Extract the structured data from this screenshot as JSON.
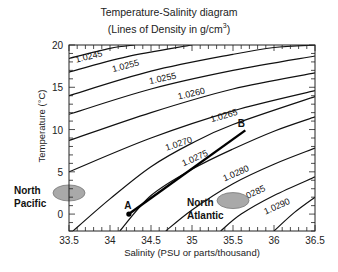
{
  "chart_data": {
    "type": "line",
    "title": "Temperature-Salinity diagram",
    "subtitle_prefix": "(Lines of Density in g/cm",
    "subtitle_sup": "3",
    "subtitle_suffix": ")",
    "xlabel": "Salinity (PSU or parts/thousand)",
    "ylabel": "Temperature (°C)",
    "xlim": [
      33.5,
      36.5
    ],
    "ylim": [
      -2,
      20
    ],
    "xticks": [
      33.5,
      34,
      34.5,
      35,
      35.5,
      36,
      36.5
    ],
    "xtick_labels": [
      "33.5",
      "34",
      "34.5",
      "35",
      "35.5",
      "36",
      "36.5"
    ],
    "yticks": [
      0,
      5,
      10,
      15,
      20
    ],
    "ytick_labels": [
      "0",
      "5",
      "10",
      "15",
      "20"
    ],
    "grid": false,
    "isopycnals": [
      {
        "label": "1.0245",
        "points": [
          [
            33.5,
            18.4
          ],
          [
            34.0,
            19.6
          ],
          [
            34.3,
            20.0
          ]
        ],
        "label_at": [
          33.75,
          18.3
        ]
      },
      {
        "label": "1.0255",
        "points": [
          [
            33.5,
            16.8
          ],
          [
            34.2,
            18.6
          ],
          [
            35.0,
            20.0
          ]
        ],
        "label_at": [
          34.2,
          17.2
        ]
      },
      {
        "label": "1.0255",
        "points": [
          [
            33.5,
            14.0
          ],
          [
            34.5,
            16.9
          ],
          [
            35.5,
            18.9
          ],
          [
            36.0,
            19.7
          ],
          [
            36.5,
            20.0
          ]
        ],
        "label_at": [
          34.65,
          15.7
        ]
      },
      {
        "label": "1.0260",
        "points": [
          [
            33.5,
            11.8
          ],
          [
            34.5,
            14.8
          ],
          [
            35.5,
            17.0
          ],
          [
            36.5,
            18.7
          ]
        ],
        "label_at": [
          35.0,
          13.9
        ]
      },
      {
        "label": "1.0265",
        "points": [
          [
            33.5,
            8.7
          ],
          [
            34.5,
            12.0
          ],
          [
            35.5,
            14.8
          ],
          [
            36.5,
            16.7
          ]
        ],
        "label_at": [
          35.4,
          11.3
        ]
      },
      {
        "label": "1.0270",
        "points": [
          [
            33.5,
            5.0
          ],
          [
            34.5,
            9.0
          ],
          [
            35.5,
            12.2
          ],
          [
            36.5,
            14.6
          ]
        ],
        "label_at": [
          34.85,
          8.0
        ]
      },
      {
        "label": "1.0275",
        "points": [
          [
            33.55,
            -2.0
          ],
          [
            34.0,
            1.8
          ],
          [
            34.5,
            5.6
          ],
          [
            35.0,
            8.4
          ],
          [
            35.5,
            10.6
          ],
          [
            36.5,
            13.9
          ]
        ],
        "label_at": [
          35.05,
          6.3
        ]
      },
      {
        "label": "1.0280",
        "points": [
          [
            34.12,
            -2.0
          ],
          [
            34.5,
            2.2
          ],
          [
            35.0,
            5.3
          ],
          [
            35.5,
            7.7
          ],
          [
            36.0,
            9.8
          ],
          [
            36.5,
            11.5
          ]
        ],
        "label_at": [
          35.55,
          4.5
        ]
      },
      {
        "label": "1.0285",
        "points": [
          [
            34.68,
            -2.0
          ],
          [
            35.0,
            0.5
          ],
          [
            35.5,
            3.6
          ],
          [
            36.0,
            5.9
          ],
          [
            36.5,
            7.8
          ]
        ],
        "label_at": [
          35.75,
          2.1
        ]
      },
      {
        "label": "1.0290",
        "points": [
          [
            35.35,
            -2.0
          ],
          [
            35.6,
            0.0
          ],
          [
            36.0,
            2.2
          ],
          [
            36.5,
            4.4
          ]
        ],
        "label_at": [
          36.05,
          0.6
        ]
      },
      {
        "label": "",
        "points": [
          [
            36.0,
            -2.0
          ],
          [
            36.25,
            0.2
          ],
          [
            36.5,
            2.0
          ]
        ]
      }
    ],
    "mixing_line": {
      "from": "A",
      "to": "B",
      "points": [
        [
          34.23,
          0.0
        ],
        [
          35.65,
          9.9
        ]
      ]
    },
    "points": [
      {
        "label": "A",
        "salinity": 34.23,
        "temperature": 0.0
      },
      {
        "label": "B",
        "salinity": 35.65,
        "temperature": 9.9
      }
    ],
    "water_masses": [
      {
        "name": "North Pacific",
        "line1": "North",
        "line2": "Pacific",
        "salinity": 33.5,
        "temperature": 2.5,
        "color": "#a9a9a9"
      },
      {
        "name": "North Atlantic",
        "line1": "North",
        "line2": "Atlantic",
        "salinity": 35.5,
        "temperature": 1.6,
        "color": "#a9a9a9"
      }
    ]
  }
}
